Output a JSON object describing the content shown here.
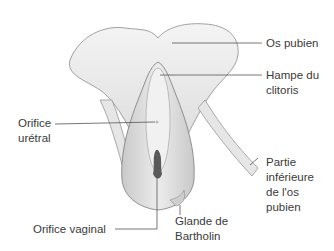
{
  "diagram": {
    "title": "",
    "style": "greyscale anatomical illustration",
    "colors": {
      "background": "#ffffff",
      "outline": "#8a8a8a",
      "shade": "#d2d2d2",
      "leader": "#555555",
      "text": "#3a3a3a"
    },
    "labels": {
      "os_pubien": "Os pubien",
      "hampe_line1": "Hampe du",
      "hampe_line2": "clitoris",
      "orifice_uretral_line1": "Orifice",
      "orifice_uretral_line2": "urétral",
      "partie_line1": "Partie",
      "partie_line2": "inférieure",
      "partie_line3": "de l'os",
      "partie_line4": "pubien",
      "orifice_vaginal": "Orifice vaginal",
      "glande_line1": "Glande de",
      "glande_line2": "Bartholin"
    }
  }
}
